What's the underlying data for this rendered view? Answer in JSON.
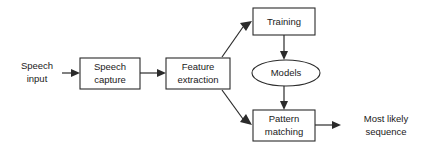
{
  "diagram": {
    "type": "flowchart",
    "background_color": "#ffffff",
    "stroke_color": "#2b2b2b",
    "text_color": "#1a1a1a",
    "nodes": [
      {
        "id": "speech-input",
        "shape": "text",
        "line1": "Speech",
        "line2": "input",
        "x": 37,
        "y": 72,
        "w": 54,
        "h": 28
      },
      {
        "id": "speech-capture",
        "shape": "rect",
        "line1": "Speech",
        "line2": "capture",
        "x": 80,
        "y": 58,
        "w": 60,
        "h": 31
      },
      {
        "id": "feature-extraction",
        "shape": "rect",
        "line1": "Feature",
        "line2": "extraction",
        "x": 166,
        "y": 58,
        "w": 64,
        "h": 31
      },
      {
        "id": "training",
        "shape": "rect",
        "line1": "Training",
        "line2": "",
        "x": 253,
        "y": 8,
        "w": 62,
        "h": 27
      },
      {
        "id": "models",
        "shape": "ellipse",
        "line1": "Models",
        "line2": "",
        "x": 252,
        "y": 60,
        "w": 68,
        "h": 26
      },
      {
        "id": "pattern-matching",
        "shape": "rect",
        "line1": "Pattern",
        "line2": "matching",
        "x": 253,
        "y": 110,
        "w": 62,
        "h": 31
      },
      {
        "id": "most-likely-sequence",
        "shape": "text",
        "line1": "Most likely",
        "line2": "sequence",
        "x": 355,
        "y": 112,
        "w": 66,
        "h": 28
      }
    ],
    "edges": [
      {
        "id": "edge-input-to-capture",
        "from": "speech-input",
        "to": "speech-capture",
        "direction": "right"
      },
      {
        "id": "edge-capture-to-feature",
        "from": "speech-capture",
        "to": "feature-extraction",
        "direction": "right"
      },
      {
        "id": "edge-feature-to-training",
        "from": "feature-extraction",
        "to": "training",
        "direction": "up-right"
      },
      {
        "id": "edge-feature-to-pattern",
        "from": "feature-extraction",
        "to": "pattern-matching",
        "direction": "down-right"
      },
      {
        "id": "edge-training-to-models",
        "from": "training",
        "to": "models",
        "direction": "down"
      },
      {
        "id": "edge-models-to-pattern",
        "from": "models",
        "to": "pattern-matching",
        "direction": "down"
      },
      {
        "id": "edge-pattern-to-output",
        "from": "pattern-matching",
        "to": "most-likely-sequence",
        "direction": "right"
      }
    ]
  }
}
